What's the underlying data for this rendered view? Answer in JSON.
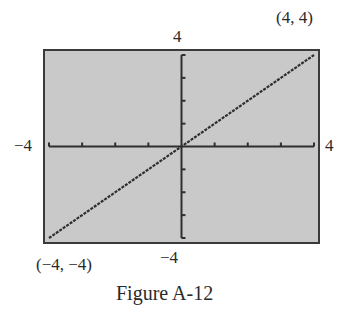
{
  "chart_data": {
    "type": "line",
    "title": "",
    "caption": "Figure A-12",
    "xlabel": "",
    "ylabel": "",
    "xlim": [
      -4,
      4
    ],
    "ylim": [
      -4,
      4
    ],
    "xscale": 1,
    "yscale": 1,
    "grid": false,
    "axes_ticks": {
      "x": [
        -4,
        -3,
        -2,
        -1,
        0,
        1,
        2,
        3,
        4
      ],
      "y": [
        -4,
        -3,
        -2,
        -1,
        0,
        1,
        2,
        3,
        4
      ]
    },
    "series": [
      {
        "name": "y = x",
        "x": [
          -4,
          4
        ],
        "y": [
          -4,
          4
        ]
      }
    ],
    "annotations": [
      {
        "text": "(4, 4)",
        "x": 4,
        "y": 4
      },
      {
        "text": "(−4, −4)",
        "x": -4,
        "y": -4
      }
    ],
    "window_labels": {
      "xmin": "−4",
      "xmax": "4",
      "ymin": "−4",
      "ymax": "4"
    },
    "colors": {
      "screen_bg": "#c9c9c9",
      "frame": "#3a3a3a",
      "axes": "#2e2e2e",
      "plot": "#2e2e2e"
    }
  }
}
